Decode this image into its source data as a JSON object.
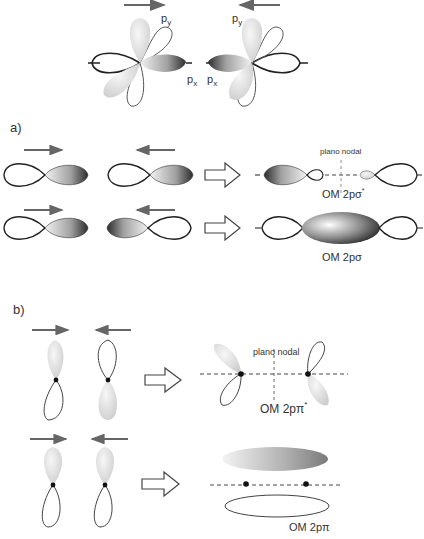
{
  "top": {
    "label_py_left": "p",
    "label_py_left_sub": "y",
    "label_px_left": "p",
    "label_px_left_sub": "x",
    "label_py_right": "p",
    "label_py_right_sub": "y",
    "label_px_right": "p",
    "label_px_right_sub": "x"
  },
  "section_a": {
    "label": "a)",
    "nodal_plane": "plano nodal",
    "antibonding": "OM 2pσ",
    "antibonding_star": "*",
    "bonding": "OM 2pσ"
  },
  "section_b": {
    "label": "b)",
    "nodal_plane": "plano nodal",
    "antibonding": "OM 2pπ",
    "antibonding_star": "*",
    "bonding": "OM 2pπ"
  },
  "colors": {
    "outline": "#333333",
    "arrow": "#666666",
    "lobe_light": "#e6e6e6",
    "lobe_dark": "#2a2a2a"
  }
}
